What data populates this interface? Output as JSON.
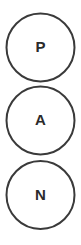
{
  "diagram": {
    "type": "vertical-chain",
    "background_color": "#ffffff",
    "stroke_color": "#3a3a3a",
    "label_color": "#2b2b2b",
    "nodes": [
      {
        "id": "node-p",
        "label": "P",
        "cx": 40.5,
        "cy": 47.5,
        "r": 34
      },
      {
        "id": "node-a",
        "label": "A",
        "cx": 40.5,
        "cy": 120.5,
        "r": 34
      },
      {
        "id": "node-n",
        "label": "N",
        "cx": 40.5,
        "cy": 195.0,
        "r": 34
      }
    ]
  }
}
